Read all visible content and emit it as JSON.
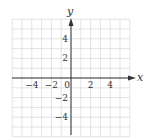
{
  "chart_data": {
    "type": "scatter",
    "title": "",
    "xlabel": "x",
    "ylabel": "y",
    "xlim": [
      -6,
      6
    ],
    "ylim": [
      -6,
      6
    ],
    "grid": true,
    "grid_step": 1,
    "x_ticks": [
      {
        "value": -4,
        "label": "−4"
      },
      {
        "value": -2,
        "label": "−2"
      },
      {
        "value": 0,
        "label": "0"
      },
      {
        "value": 2,
        "label": "2"
      },
      {
        "value": 4,
        "label": "4"
      }
    ],
    "y_ticks": [
      {
        "value": 4,
        "label": "4"
      },
      {
        "value": 2,
        "label": "2"
      },
      {
        "value": -2,
        "label": "−2"
      },
      {
        "value": -4,
        "label": "−4"
      }
    ],
    "series": [],
    "colors": {
      "grid": "#d0d0d0",
      "axis": "#333333",
      "background": "#ffffff"
    }
  }
}
